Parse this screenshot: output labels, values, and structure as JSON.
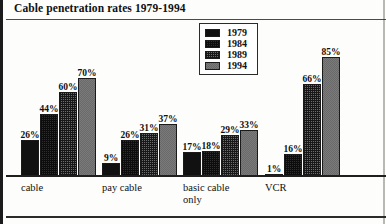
{
  "chart_data": {
    "type": "bar",
    "title": "Cable penetration rates 1979-1994",
    "xlabel": "",
    "ylabel": "",
    "ylim": [
      0,
      100
    ],
    "grid": false,
    "legend_position": "top-center",
    "value_suffix": "%",
    "categories": [
      "cable",
      "pay cable",
      "basic cable\nonly",
      "VCR"
    ],
    "series": [
      {
        "name": "1979",
        "values": [
          26,
          9,
          17,
          1
        ],
        "swatch": "solid-black"
      },
      {
        "name": "1984",
        "values": [
          44,
          26,
          18,
          16
        ],
        "swatch": "dense-crosshatch"
      },
      {
        "name": "1989",
        "values": [
          60,
          31,
          29,
          66
        ],
        "swatch": "medium-dots"
      },
      {
        "name": "1994",
        "values": [
          70,
          37,
          33,
          85
        ],
        "swatch": "light-checker"
      }
    ],
    "data_labels": [
      [
        "26%",
        "44%",
        "60%",
        "70%"
      ],
      [
        "9%",
        "26%",
        "31%",
        "37%"
      ],
      [
        "17%",
        "18%",
        "29%",
        "33%"
      ],
      [
        "1%",
        "16%",
        "66%",
        "85%"
      ]
    ],
    "colors": {
      "axis": "#1f1f1f",
      "text": "#101010",
      "background": "#fdfdfb",
      "series_1979": "#111111",
      "series_1984": "#2e2e2e",
      "series_1989": "#6d6d6d",
      "series_1994": "#d3d3d0"
    }
  },
  "legend": {
    "items": [
      {
        "label": "1979"
      },
      {
        "label": "1984"
      },
      {
        "label": "1989"
      },
      {
        "label": "1994"
      }
    ]
  }
}
